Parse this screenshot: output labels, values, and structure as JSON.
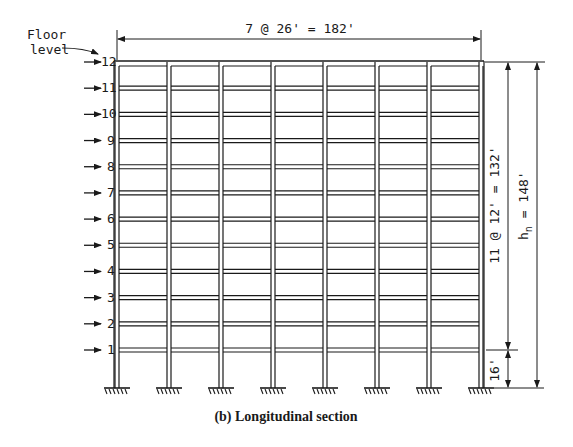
{
  "figure": {
    "caption": "(b)  Longitudinal section",
    "floor_level_label_line1": "Floor",
    "floor_level_label_line2": "level",
    "floor_labels": [
      "12",
      "11",
      "10",
      "9",
      "8",
      "7",
      "6",
      "5",
      "4",
      "3",
      "2",
      "1"
    ],
    "top_dimension": "7 @ 26' = 182'",
    "right_dimension_typical": "11 @ 12' = 132'",
    "right_dimension_total_main": "h",
    "right_dimension_total_sub": "n",
    "right_dimension_total_rest": " = 148'",
    "bottom_story_dimension": "16'",
    "bays": 7,
    "bay_width_ft": 26,
    "stories": 12,
    "typical_story_height_ft": 12,
    "first_story_height_ft": 16,
    "total_height_ft": 148,
    "total_width_ft": 182,
    "colors": {
      "line": "#1a1a1a",
      "background": "#ffffff"
    }
  }
}
